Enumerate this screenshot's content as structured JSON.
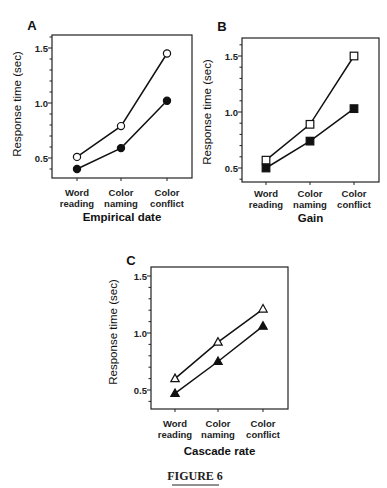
{
  "figure": {
    "caption": "FIGURE 6"
  },
  "chart_data": [
    {
      "panel": "A",
      "type": "line",
      "title": "",
      "panel_label": "A",
      "xlabel": "Empirical date",
      "ylabel": "Response time (sec)",
      "categories": [
        [
          "Word",
          "reading"
        ],
        [
          "Color",
          "naming"
        ],
        [
          "Color",
          "conflict"
        ]
      ],
      "yticks": [
        "0.5",
        "1.0",
        "1.5"
      ],
      "ylim": [
        0.35,
        1.6
      ],
      "grid": false,
      "legend": null,
      "series": [
        {
          "name": "open-circle",
          "marker": "circle",
          "filled": false,
          "values": [
            0.51,
            0.79,
            1.45
          ]
        },
        {
          "name": "filled-circle",
          "marker": "circle",
          "filled": true,
          "values": [
            0.4,
            0.59,
            1.02
          ]
        }
      ]
    },
    {
      "panel": "B",
      "type": "line",
      "title": "",
      "panel_label": "B",
      "xlabel": "Gain",
      "ylabel": "Response time (sec)",
      "categories": [
        [
          "Word",
          "reading"
        ],
        [
          "Color",
          "naming"
        ],
        [
          "Color",
          "conflict"
        ]
      ],
      "yticks": [
        "0.5",
        "1.0",
        "1.5"
      ],
      "ylim": [
        0.37,
        1.67
      ],
      "grid": false,
      "legend": null,
      "series": [
        {
          "name": "open-square",
          "marker": "square",
          "filled": false,
          "values": [
            0.57,
            0.89,
            1.5
          ]
        },
        {
          "name": "filled-square",
          "marker": "square",
          "filled": true,
          "values": [
            0.5,
            0.74,
            1.03
          ]
        }
      ]
    },
    {
      "panel": "C",
      "type": "line",
      "title": "",
      "panel_label": "C",
      "xlabel": "Cascade rate",
      "ylabel": "Response time (sec)",
      "categories": [
        [
          "Word",
          "reading"
        ],
        [
          "Color",
          "naming"
        ],
        [
          "Color",
          "conflict"
        ]
      ],
      "yticks": [
        "0.5",
        "1.0",
        "1.5"
      ],
      "ylim": [
        0.33,
        1.6
      ],
      "grid": false,
      "legend": null,
      "series": [
        {
          "name": "open-triangle",
          "marker": "triangle",
          "filled": false,
          "values": [
            0.6,
            0.92,
            1.21
          ]
        },
        {
          "name": "filled-triangle",
          "marker": "triangle",
          "filled": true,
          "values": [
            0.47,
            0.75,
            1.06
          ]
        }
      ]
    }
  ]
}
